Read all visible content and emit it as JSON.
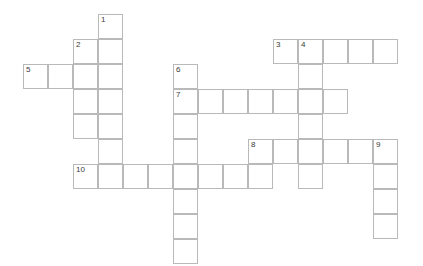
{
  "puzzle": {
    "title": "Crossword Puzzle Grid",
    "grid": {
      "origin_x": 23,
      "origin_y": 14,
      "cell_size": 25,
      "border_color": "#b9b9b9",
      "cell_color": "#ffffff",
      "number_color": "#3a3a3a"
    },
    "entries": [
      {
        "number": "1",
        "direction": "down",
        "col": 3,
        "row": 0,
        "length": 7
      },
      {
        "number": "2",
        "direction": "down",
        "col": 2,
        "row": 1,
        "length": 4
      },
      {
        "number": "3",
        "direction": "across",
        "col": 10,
        "row": 1,
        "length": 5
      },
      {
        "number": "4",
        "direction": "down",
        "col": 11,
        "row": 1,
        "length": 6
      },
      {
        "number": "5",
        "direction": "across",
        "col": 0,
        "row": 2,
        "length": 4
      },
      {
        "number": "6",
        "direction": "down",
        "col": 6,
        "row": 2,
        "length": 8
      },
      {
        "number": "7",
        "direction": "across",
        "col": 6,
        "row": 3,
        "length": 7
      },
      {
        "number": "8",
        "direction": "across",
        "col": 9,
        "row": 5,
        "length": 6
      },
      {
        "number": "9",
        "direction": "down",
        "col": 14,
        "row": 5,
        "length": 4
      },
      {
        "number": "10",
        "direction": "across",
        "col": 2,
        "row": 6,
        "length": 8
      }
    ],
    "cells": [
      {
        "col": 3,
        "row": 0,
        "number": "1"
      },
      {
        "col": 3,
        "row": 1,
        "number": ""
      },
      {
        "col": 2,
        "row": 1,
        "number": "2"
      },
      {
        "col": 10,
        "row": 1,
        "number": "3"
      },
      {
        "col": 11,
        "row": 1,
        "number": "4"
      },
      {
        "col": 12,
        "row": 1,
        "number": ""
      },
      {
        "col": 13,
        "row": 1,
        "number": ""
      },
      {
        "col": 14,
        "row": 1,
        "number": ""
      },
      {
        "col": 0,
        "row": 2,
        "number": "5"
      },
      {
        "col": 1,
        "row": 2,
        "number": ""
      },
      {
        "col": 2,
        "row": 2,
        "number": ""
      },
      {
        "col": 3,
        "row": 2,
        "number": ""
      },
      {
        "col": 6,
        "row": 2,
        "number": "6"
      },
      {
        "col": 11,
        "row": 2,
        "number": ""
      },
      {
        "col": 2,
        "row": 3,
        "number": ""
      },
      {
        "col": 3,
        "row": 3,
        "number": ""
      },
      {
        "col": 6,
        "row": 3,
        "number": "7"
      },
      {
        "col": 7,
        "row": 3,
        "number": ""
      },
      {
        "col": 8,
        "row": 3,
        "number": ""
      },
      {
        "col": 9,
        "row": 3,
        "number": ""
      },
      {
        "col": 10,
        "row": 3,
        "number": ""
      },
      {
        "col": 11,
        "row": 3,
        "number": ""
      },
      {
        "col": 12,
        "row": 3,
        "number": ""
      },
      {
        "col": 2,
        "row": 4,
        "number": ""
      },
      {
        "col": 3,
        "row": 4,
        "number": ""
      },
      {
        "col": 6,
        "row": 4,
        "number": ""
      },
      {
        "col": 11,
        "row": 4,
        "number": ""
      },
      {
        "col": 3,
        "row": 5,
        "number": ""
      },
      {
        "col": 6,
        "row": 5,
        "number": ""
      },
      {
        "col": 9,
        "row": 5,
        "number": "8"
      },
      {
        "col": 10,
        "row": 5,
        "number": ""
      },
      {
        "col": 11,
        "row": 5,
        "number": ""
      },
      {
        "col": 12,
        "row": 5,
        "number": ""
      },
      {
        "col": 13,
        "row": 5,
        "number": ""
      },
      {
        "col": 14,
        "row": 5,
        "number": "9"
      },
      {
        "col": 2,
        "row": 6,
        "number": "10"
      },
      {
        "col": 3,
        "row": 6,
        "number": ""
      },
      {
        "col": 4,
        "row": 6,
        "number": ""
      },
      {
        "col": 5,
        "row": 6,
        "number": ""
      },
      {
        "col": 6,
        "row": 6,
        "number": ""
      },
      {
        "col": 7,
        "row": 6,
        "number": ""
      },
      {
        "col": 8,
        "row": 6,
        "number": ""
      },
      {
        "col": 9,
        "row": 6,
        "number": ""
      },
      {
        "col": 11,
        "row": 6,
        "number": ""
      },
      {
        "col": 14,
        "row": 6,
        "number": ""
      },
      {
        "col": 6,
        "row": 7,
        "number": ""
      },
      {
        "col": 14,
        "row": 7,
        "number": ""
      },
      {
        "col": 6,
        "row": 8,
        "number": ""
      },
      {
        "col": 14,
        "row": 8,
        "number": ""
      },
      {
        "col": 6,
        "row": 9,
        "number": ""
      }
    ]
  }
}
